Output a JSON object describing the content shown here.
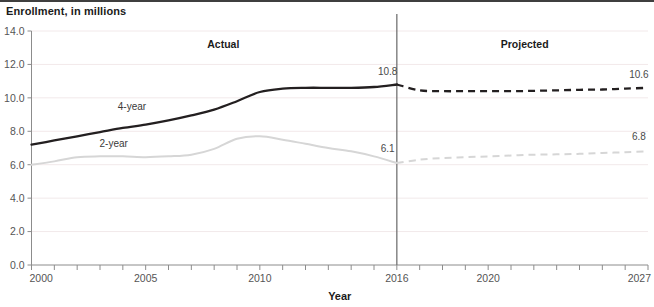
{
  "chart_data": {
    "type": "line",
    "title": "Enrollment, in millions",
    "xlabel": "Year",
    "ylabel": "",
    "xlim": [
      2000,
      2027
    ],
    "ylim": [
      0.0,
      14.0
    ],
    "grid": true,
    "legend_position": "inline-series-labels",
    "y_ticks": [
      "0.0",
      "2.0",
      "4.0",
      "6.0",
      "8.0",
      "10.0",
      "12.0",
      "14.0"
    ],
    "y_tick_values": [
      0,
      2,
      4,
      6,
      8,
      10,
      12,
      14
    ],
    "x_ticks_labeled": [
      "2000",
      "2005",
      "2010",
      "2016",
      "2020",
      "2027"
    ],
    "x_tick_values": [
      2000,
      2005,
      2010,
      2016,
      2020,
      2027
    ],
    "x_minor_ticks": [
      2001,
      2002,
      2003,
      2004,
      2006,
      2007,
      2008,
      2009,
      2011,
      2012,
      2013,
      2014,
      2015,
      2017,
      2018,
      2019,
      2021,
      2022,
      2023,
      2024,
      2025,
      2026
    ],
    "divider_year": 2016,
    "annotations": [
      {
        "name": "actual-region-label",
        "text": "Actual",
        "x": 2008.4,
        "y": 13.0
      },
      {
        "name": "projected-region-label",
        "text": "Projected",
        "x": 2021.6,
        "y": 13.0
      },
      {
        "name": "four-year-series-label",
        "text": "4-year",
        "x": 2004.4,
        "y": 9.25
      },
      {
        "name": "two-year-series-label",
        "text": "2-year",
        "x": 2003.6,
        "y": 7.05
      },
      {
        "name": "four-year-actual-endpoint-label",
        "text": "10.8",
        "x": 2015.6,
        "y": 11.35
      },
      {
        "name": "two-year-actual-endpoint-label",
        "text": "6.1",
        "x": 2015.6,
        "y": 6.75
      },
      {
        "name": "four-year-projected-endpoint-label",
        "text": "10.6",
        "x": 2026.6,
        "y": 11.2
      },
      {
        "name": "two-year-projected-endpoint-label",
        "text": "6.8",
        "x": 2026.6,
        "y": 7.5
      }
    ],
    "x": [
      2000,
      2001,
      2002,
      2003,
      2004,
      2005,
      2006,
      2007,
      2008,
      2009,
      2010,
      2011,
      2012,
      2013,
      2014,
      2015,
      2016,
      2017,
      2018,
      2019,
      2020,
      2021,
      2022,
      2023,
      2024,
      2025,
      2026,
      2027
    ],
    "series": [
      {
        "name": "4-year",
        "color": "#231f20",
        "actual_style": "solid",
        "projected_style": "dashed",
        "values": [
          7.2,
          7.45,
          7.7,
          7.95,
          8.2,
          8.4,
          8.65,
          8.95,
          9.3,
          9.8,
          10.35,
          10.55,
          10.6,
          10.6,
          10.6,
          10.65,
          10.8,
          10.45,
          10.4,
          10.4,
          10.4,
          10.4,
          10.42,
          10.45,
          10.48,
          10.5,
          10.55,
          10.6
        ],
        "label_first": "10.8",
        "label_last": "10.6"
      },
      {
        "name": "2-year",
        "color": "#d6d6d6",
        "actual_style": "solid",
        "projected_style": "dashed",
        "values": [
          6.0,
          6.2,
          6.45,
          6.5,
          6.5,
          6.45,
          6.5,
          6.6,
          6.95,
          7.55,
          7.7,
          7.5,
          7.25,
          7.0,
          6.8,
          6.5,
          6.1,
          6.3,
          6.4,
          6.45,
          6.5,
          6.55,
          6.6,
          6.62,
          6.65,
          6.7,
          6.75,
          6.8
        ],
        "label_first": "6.1",
        "label_last": "6.8"
      }
    ]
  }
}
